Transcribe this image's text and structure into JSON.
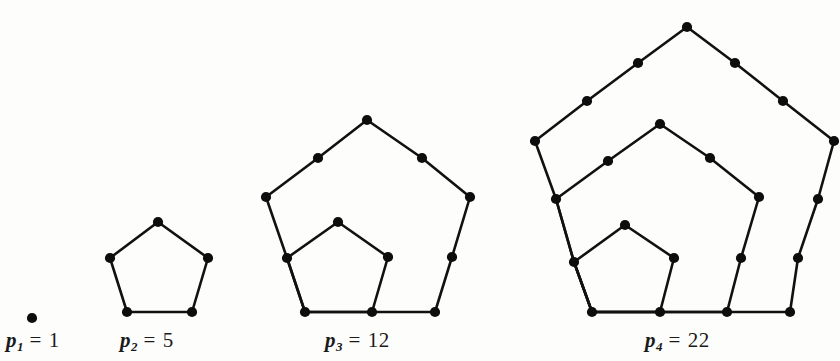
{
  "figure": {
    "background_color": "#fdfdfc",
    "ink_color": "#111111",
    "vertex_color": "#0d0d0d"
  },
  "captions": [
    {
      "name": "p1",
      "symbol": "p",
      "subscript": "1",
      "equals": "=",
      "value": "1",
      "text": "p1 = 1",
      "x": 6,
      "y": 330
    },
    {
      "name": "p2",
      "symbol": "p",
      "subscript": "2",
      "equals": "=",
      "value": "5",
      "text": "p2 = 5",
      "x": 120,
      "y": 330
    },
    {
      "name": "p3",
      "symbol": "p",
      "subscript": "3",
      "equals": "=",
      "value": "12",
      "text": "p3 = 12",
      "x": 325,
      "y": 330
    },
    {
      "name": "p4",
      "symbol": "p",
      "subscript": "4",
      "equals": "=",
      "value": "22",
      "text": "p4 = 22",
      "x": 645,
      "y": 330
    }
  ],
  "chart_data": {
    "type": "diagram",
    "sequence_name": "pentagonal numbers",
    "index_label": "n",
    "value_label": "p_n",
    "categories": [
      "p1",
      "p2",
      "p3",
      "p4"
    ],
    "values": [
      1,
      5,
      12,
      22
    ],
    "figures": [
      {
        "label": "p1 = 1",
        "index": 1,
        "value": 1,
        "dot_count": 1,
        "edges": [],
        "vertices": [
          [
            32,
            318
          ]
        ]
      },
      {
        "label": "p2 = 5",
        "index": 2,
        "value": 5,
        "dot_count": 5,
        "edges": [
          [
            [
              158,
              222
            ],
            [
              110,
              258
            ]
          ],
          [
            [
              110,
              258
            ],
            [
              127,
              312
            ]
          ],
          [
            [
              127,
              312
            ],
            [
              192,
              312
            ]
          ],
          [
            [
              192,
              312
            ],
            [
              208,
              258
            ]
          ],
          [
            [
              208,
              258
            ],
            [
              158,
              222
            ]
          ]
        ],
        "vertices": [
          [
            158,
            222
          ],
          [
            110,
            258
          ],
          [
            208,
            258
          ],
          [
            127,
            312
          ],
          [
            192,
            312
          ]
        ]
      },
      {
        "label": "p3 = 12",
        "index": 3,
        "value": 12,
        "dot_count": 12,
        "edges": [
          [
            [
              367,
              120
            ],
            [
              318,
              158
            ]
          ],
          [
            [
              318,
              158
            ],
            [
              266,
              197
            ]
          ],
          [
            [
              266,
              197
            ],
            [
              287,
              258
            ]
          ],
          [
            [
              287,
              258
            ],
            [
              305,
              312
            ]
          ],
          [
            [
              305,
              312
            ],
            [
              372,
              312
            ]
          ],
          [
            [
              372,
              312
            ],
            [
              435,
              312
            ]
          ],
          [
            [
              435,
              312
            ],
            [
              452,
              257
            ]
          ],
          [
            [
              452,
              257
            ],
            [
              470,
              197
            ]
          ],
          [
            [
              470,
              197
            ],
            [
              422,
              158
            ]
          ],
          [
            [
              422,
              158
            ],
            [
              367,
              120
            ]
          ],
          [
            [
              338,
              222
            ],
            [
              287,
              258
            ]
          ],
          [
            [
              287,
              258
            ],
            [
              305,
              312
            ]
          ],
          [
            [
              305,
              312
            ],
            [
              372,
              312
            ]
          ],
          [
            [
              372,
              312
            ],
            [
              388,
              257
            ]
          ],
          [
            [
              388,
              257
            ],
            [
              338,
              222
            ]
          ]
        ],
        "vertices": [
          [
            367,
            120
          ],
          [
            318,
            158
          ],
          [
            422,
            158
          ],
          [
            266,
            197
          ],
          [
            470,
            197
          ],
          [
            287,
            258
          ],
          [
            452,
            257
          ],
          [
            305,
            312
          ],
          [
            435,
            312
          ],
          [
            338,
            222
          ],
          [
            388,
            257
          ],
          [
            372,
            312
          ]
        ]
      },
      {
        "label": "p4 = 22",
        "index": 4,
        "value": 22,
        "dot_count": 22,
        "edges": [
          [
            [
              687,
              27
            ],
            [
              638,
              63
            ]
          ],
          [
            [
              638,
              63
            ],
            [
              587,
              101
            ]
          ],
          [
            [
              587,
              101
            ],
            [
              535,
              141
            ]
          ],
          [
            [
              535,
              141
            ],
            [
              556,
              199
            ]
          ],
          [
            [
              556,
              199
            ],
            [
              574,
              262
            ]
          ],
          [
            [
              574,
              262
            ],
            [
              592,
              312
            ]
          ],
          [
            [
              592,
              312
            ],
            [
              660,
              312
            ]
          ],
          [
            [
              660,
              312
            ],
            [
              727,
              312
            ]
          ],
          [
            [
              727,
              312
            ],
            [
              790,
              312
            ]
          ],
          [
            [
              790,
              312
            ],
            [
              798,
              258
            ]
          ],
          [
            [
              798,
              258
            ],
            [
              818,
              199
            ]
          ],
          [
            [
              818,
              199
            ],
            [
              834,
              141
            ]
          ],
          [
            [
              834,
              141
            ],
            [
              783,
              101
            ]
          ],
          [
            [
              783,
              101
            ],
            [
              735,
              63
            ]
          ],
          [
            [
              735,
              63
            ],
            [
              687,
              27
            ]
          ],
          [
            [
              660,
              124
            ],
            [
              608,
              161
            ]
          ],
          [
            [
              608,
              161
            ],
            [
              556,
              199
            ]
          ],
          [
            [
              556,
              199
            ],
            [
              574,
              262
            ]
          ],
          [
            [
              574,
              262
            ],
            [
              592,
              312
            ]
          ],
          [
            [
              592,
              312
            ],
            [
              660,
              312
            ]
          ],
          [
            [
              660,
              312
            ],
            [
              727,
              312
            ]
          ],
          [
            [
              727,
              312
            ],
            [
              741,
              258
            ]
          ],
          [
            [
              741,
              258
            ],
            [
              759,
              197
            ]
          ],
          [
            [
              759,
              197
            ],
            [
              710,
              158
            ]
          ],
          [
            [
              710,
              158
            ],
            [
              660,
              124
            ]
          ],
          [
            [
              625,
              225
            ],
            [
              574,
              262
            ]
          ],
          [
            [
              574,
              262
            ],
            [
              592,
              312
            ]
          ],
          [
            [
              592,
              312
            ],
            [
              660,
              312
            ]
          ],
          [
            [
              660,
              312
            ],
            [
              674,
              258
            ]
          ],
          [
            [
              674,
              258
            ],
            [
              625,
              225
            ]
          ]
        ],
        "vertices": [
          [
            687,
            27
          ],
          [
            638,
            63
          ],
          [
            735,
            63
          ],
          [
            587,
            101
          ],
          [
            783,
            101
          ],
          [
            535,
            141
          ],
          [
            834,
            141
          ],
          [
            556,
            199
          ],
          [
            818,
            199
          ],
          [
            574,
            262
          ],
          [
            798,
            258
          ],
          [
            592,
            312
          ],
          [
            790,
            312
          ],
          [
            660,
            124
          ],
          [
            608,
            161
          ],
          [
            710,
            158
          ],
          [
            759,
            197
          ],
          [
            741,
            258
          ],
          [
            727,
            312
          ],
          [
            625,
            225
          ],
          [
            674,
            258
          ],
          [
            660,
            312
          ]
        ]
      }
    ]
  }
}
